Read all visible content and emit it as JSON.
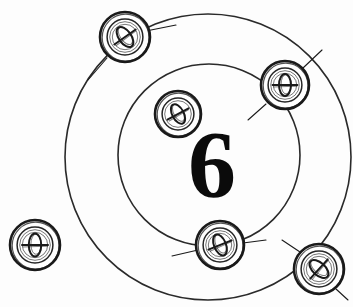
{
  "figure": {
    "type": "technical-line-drawing",
    "background_color": "#fdfdfd",
    "line_color": "#1a1a1a",
    "canvas": {
      "width": 353,
      "height": 307
    }
  },
  "center_label": {
    "text": "6",
    "x": 212,
    "y": 165,
    "font_size": 96,
    "color": "#0b0b0b"
  },
  "circles": [
    {
      "name": "outer-bolt-circle",
      "label": "outer circle",
      "cx": 208,
      "cy": 157,
      "r": 143,
      "stroke": "#2a2a2a",
      "stroke_width": 1.6
    },
    {
      "name": "inner-bolt-circle",
      "label": "inner circle",
      "cx": 209,
      "cy": 155,
      "r": 91,
      "stroke": "#2a2a2a",
      "stroke_width": 1.6
    }
  ],
  "fasteners": [
    {
      "id": "screw-top-left",
      "label": "screw head top-left",
      "cx": 125,
      "cy": 37,
      "r": 25,
      "slot": "diagonal",
      "slot_angle": -35,
      "ring_count": 3
    },
    {
      "id": "screw-upper-right",
      "label": "screw head upper-right",
      "cx": 285,
      "cy": 85,
      "r": 24,
      "slot": "vertical",
      "slot_angle": 0,
      "ring_count": 3
    },
    {
      "id": "screw-inner-top",
      "label": "screw head inner-top",
      "cx": 178,
      "cy": 114,
      "r": 23,
      "slot": "diagonal",
      "slot_angle": -28,
      "ring_count": 2
    },
    {
      "id": "screw-inner-bottom",
      "label": "screw head inner-bottom",
      "cx": 220,
      "cy": 245,
      "r": 24,
      "slot": "diagonal",
      "slot_angle": -22,
      "ring_count": 3
    },
    {
      "id": "screw-lower-right",
      "label": "screw head lower-right",
      "cx": 319,
      "cy": 269,
      "r": 25,
      "slot": "diagonal",
      "slot_angle": -48,
      "ring_count": 3
    },
    {
      "id": "screw-left-detached",
      "label": "screw head left detached",
      "cx": 35,
      "cy": 245,
      "r": 25,
      "slot": "vertical",
      "slot_angle": 0,
      "ring_count": 3
    }
  ],
  "leader_lines": [
    {
      "name": "leader-top-left",
      "x1": 107,
      "y1": 58,
      "x2": 88,
      "y2": 80
    },
    {
      "name": "leader-top-right",
      "x1": 146,
      "y1": 31,
      "x2": 176,
      "y2": 25
    },
    {
      "name": "leader-upper-right",
      "x1": 303,
      "y1": 68,
      "x2": 322,
      "y2": 50
    },
    {
      "name": "leader-upper-right-2",
      "x1": 266,
      "y1": 104,
      "x2": 248,
      "y2": 120
    },
    {
      "name": "leader-lower-right",
      "x1": 300,
      "y1": 252,
      "x2": 282,
      "y2": 240
    },
    {
      "name": "leader-lower-right-2",
      "x1": 336,
      "y1": 289,
      "x2": 348,
      "y2": 300
    },
    {
      "name": "leader-inner-bottom",
      "x1": 198,
      "y1": 250,
      "x2": 172,
      "y2": 256
    },
    {
      "name": "leader-inner-bottom-2",
      "x1": 243,
      "y1": 243,
      "x2": 266,
      "y2": 240
    }
  ]
}
